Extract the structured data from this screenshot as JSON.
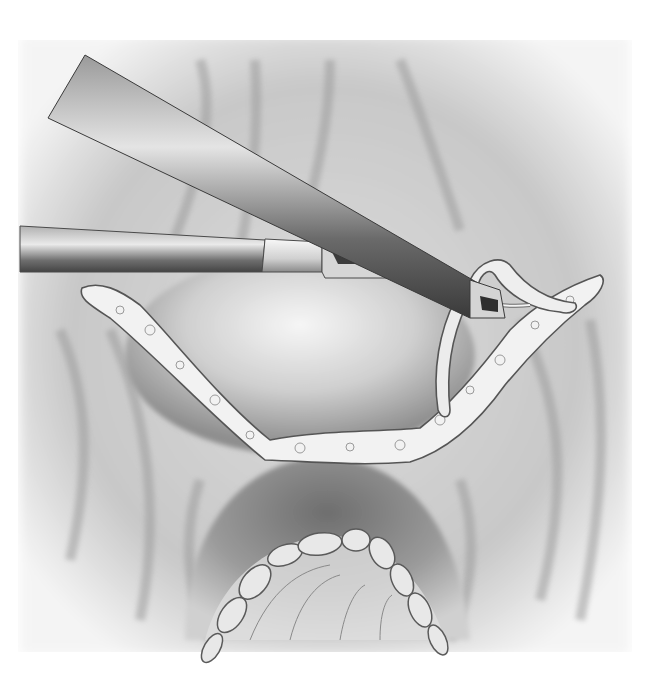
{
  "illustration": {
    "subject": "laparoscopic surgical illustration",
    "style": "grayscale pencil rendering",
    "colors": {
      "background": "#ffffff",
      "field": "#e6e6e6",
      "shadow": "#8c8c8c",
      "instrument_dark": "#3a3a3a",
      "instrument_light": "#d8d8d8",
      "tissue_light": "#f0f0f0",
      "outline": "#5a5a5a"
    },
    "elements": [
      "upper-laparoscopic-instrument",
      "lower-grasper-instrument",
      "curved-probe-tip",
      "upper-tissue-band",
      "central-dome",
      "lower-dome",
      "lower-nodular-arch",
      "peritoneal-folds"
    ]
  }
}
